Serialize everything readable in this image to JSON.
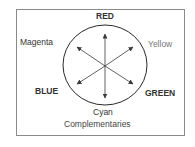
{
  "diagram": {
    "caption": "Complementaries",
    "labels": {
      "red": "RED",
      "yellow": "Yellow",
      "green": "GREEN",
      "cyan": "Cyan",
      "blue": "BLUE",
      "magenta": "Magenta"
    },
    "pairs": [
      [
        "RED",
        "Cyan"
      ],
      [
        "Yellow",
        "BLUE"
      ],
      [
        "Magenta",
        "GREEN"
      ]
    ],
    "colors": {
      "frame": "#8a8a8a",
      "circle": "#2a2a2a",
      "arrows": "#3a3a3a",
      "primary_text": "#333333",
      "secondary_text": "#777777"
    }
  }
}
